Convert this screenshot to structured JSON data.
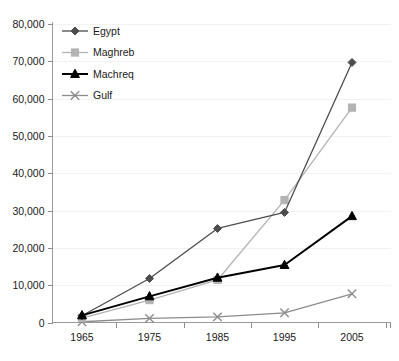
{
  "chart_data": {
    "type": "line",
    "title": "",
    "subtitle": "",
    "xlabel": "",
    "ylabel": "",
    "categories": [
      "1965",
      "1975",
      "1985",
      "1995",
      "2005"
    ],
    "x_tick_labels": [
      "1965",
      "1975",
      "1985",
      "1995",
      "2005"
    ],
    "y_tick_labels": [
      "0",
      "10,000",
      "20,000",
      "30,000",
      "40,000",
      "50,000",
      "60,000",
      "70,000",
      "80,000"
    ],
    "y_tick_values": [
      0,
      10000,
      20000,
      30000,
      40000,
      50000,
      60000,
      70000,
      80000
    ],
    "ylim": [
      0,
      80000
    ],
    "grid": true,
    "legend_position": "top-left",
    "series": [
      {
        "name": "Egypt",
        "marker": "diamond",
        "color": "#4d4d4d",
        "values": [
          1800,
          11800,
          25200,
          29500,
          69700
        ]
      },
      {
        "name": "Maghreb",
        "marker": "square",
        "color": "#b3b3b3",
        "values": [
          1200,
          6000,
          11400,
          32800,
          57600
        ]
      },
      {
        "name": "Machreq",
        "marker": "triangle",
        "color": "#000000",
        "values": [
          1900,
          7000,
          12000,
          15400,
          28500
        ]
      },
      {
        "name": "Gulf",
        "marker": "cross",
        "color": "#8c8c8c",
        "values": [
          200,
          1100,
          1500,
          2600,
          7700
        ]
      }
    ]
  },
  "legend": {
    "entries": [
      {
        "label": "Egypt"
      },
      {
        "label": "Maghreb"
      },
      {
        "label": "Machreq"
      },
      {
        "label": "Gulf"
      }
    ]
  }
}
